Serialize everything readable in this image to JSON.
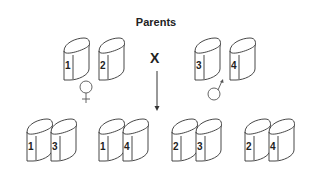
{
  "title": "Parents",
  "cross_symbol": "X",
  "parents": {
    "female": {
      "symbol": "female-symbol",
      "chromosomes": [
        "1",
        "2"
      ]
    },
    "male": {
      "symbol": "male-symbol",
      "chromosomes": [
        "3",
        "4"
      ]
    }
  },
  "offspring": [
    {
      "chromosomes": [
        "1",
        "3"
      ]
    },
    {
      "chromosomes": [
        "1",
        "4"
      ]
    },
    {
      "chromosomes": [
        "2",
        "3"
      ]
    },
    {
      "chromosomes": [
        "2",
        "4"
      ]
    }
  ],
  "colors": {
    "stroke": "#333333",
    "background": "#ffffff"
  }
}
